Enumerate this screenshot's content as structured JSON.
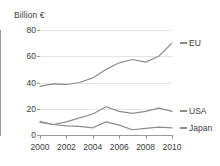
{
  "chart_data": {
    "type": "line",
    "title": "",
    "subtitle": "",
    "ylabel": "Billion €",
    "xlabel": "",
    "x": [
      2000,
      2001,
      2002,
      2003,
      2004,
      2005,
      2006,
      2007,
      2008,
      2009,
      2010
    ],
    "xtick_labels": [
      "2000",
      "2002",
      "2004",
      "2006",
      "2008",
      "2010"
    ],
    "xticks": [
      2000,
      2002,
      2004,
      2006,
      2008,
      2010
    ],
    "ytick_labels": [
      "0",
      "20",
      "40",
      "60",
      "80"
    ],
    "yticks": [
      0,
      20,
      40,
      60,
      80
    ],
    "ylim": [
      0,
      80
    ],
    "xlim": [
      2000,
      2010
    ],
    "grid": "horizontal",
    "legend_position": "right",
    "series": [
      {
        "name": "EU",
        "color": "#8c8c8c",
        "values": [
          37,
          39,
          38.5,
          40,
          43.5,
          50,
          55,
          57.5,
          55.5,
          60,
          70
        ]
      },
      {
        "name": "USA",
        "color": "#8c8c8c",
        "values": [
          10.5,
          8,
          10,
          13,
          16,
          21.5,
          18,
          16.5,
          18,
          20.5,
          18
        ]
      },
      {
        "name": "Japan",
        "color": "#8c8c8c",
        "values": [
          9.5,
          8,
          7,
          6.5,
          5.5,
          10,
          7.5,
          4,
          5,
          6,
          5.5
        ]
      }
    ]
  },
  "axis": {
    "y_title": "Billion €"
  },
  "colors": {
    "line": "#8c8c8c",
    "grid": "#e4e4e4",
    "axis": "#9a9a9a",
    "text": "#3b3b3b"
  }
}
